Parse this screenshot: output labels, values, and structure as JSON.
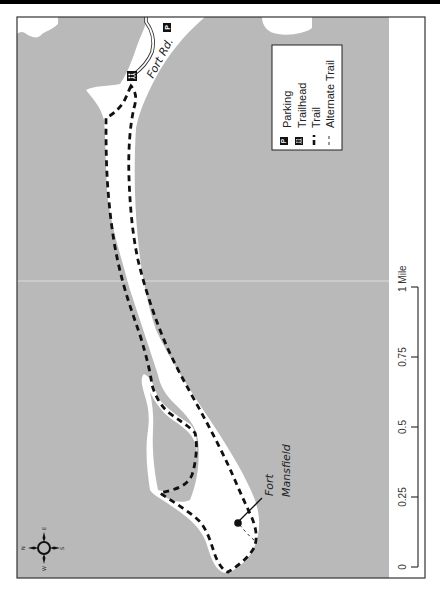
{
  "map": {
    "water_color": "#b9b9b9",
    "land_color": "#ffffff",
    "trail_color": "#111111",
    "frame_color": "#333333"
  },
  "legend": {
    "items": [
      {
        "icon": "parking-icon",
        "symbol": "P",
        "label": "Parking"
      },
      {
        "icon": "trailhead-icon",
        "symbol": "hikers",
        "label": "Trailhead"
      },
      {
        "icon": "trail-line-icon",
        "symbol": "dashed-heavy",
        "label": "Trail"
      },
      {
        "icon": "alternate-trail-line-icon",
        "symbol": "dashed-light",
        "label": "Alternate Trail"
      }
    ]
  },
  "labels": {
    "road": "Fort Rd.",
    "landmark_line1": "Fort",
    "landmark_line2": "Mansfield",
    "parking_symbol": "P"
  },
  "compass": {
    "n": "N",
    "e": "E",
    "s": "S",
    "w": "W"
  },
  "scale_bar": {
    "ticks": [
      "0",
      "0.25",
      "0.5",
      "0.75",
      "1 Mile"
    ],
    "unit": "Mile"
  }
}
